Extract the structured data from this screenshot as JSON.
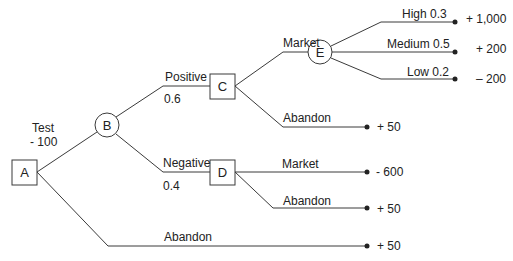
{
  "diagram": {
    "type": "decision-tree",
    "nodes": {
      "A": {
        "label": "A",
        "shape": "square"
      },
      "B": {
        "label": "B",
        "shape": "circle"
      },
      "C": {
        "label": "C",
        "shape": "square"
      },
      "D": {
        "label": "D",
        "shape": "square"
      },
      "E": {
        "label": "E",
        "shape": "circle"
      }
    },
    "branches": {
      "test": {
        "label": "Test",
        "value": "- 100"
      },
      "positive": {
        "label": "Positive",
        "prob": "0.6"
      },
      "negative": {
        "label": "Negative",
        "prob": "0.4"
      },
      "c_market": {
        "label": "Market"
      },
      "c_abandon": {
        "label": "Abandon",
        "payoff": "+ 50"
      },
      "e_high": {
        "label": "High  0.3",
        "payoff": "+ 1,000"
      },
      "e_medium": {
        "label": "Medium 0.5",
        "payoff": "+ 200"
      },
      "e_low": {
        "label": "Low 0.2",
        "payoff": "– 200"
      },
      "d_market": {
        "label": "Market",
        "payoff": "- 600"
      },
      "d_abandon": {
        "label": "Abandon",
        "payoff": "+ 50"
      },
      "a_abandon": {
        "label": "Abandon",
        "payoff": "+ 50"
      }
    },
    "colors": {
      "line": "#3a3a3a",
      "text": "#222222",
      "background": "#ffffff"
    }
  }
}
